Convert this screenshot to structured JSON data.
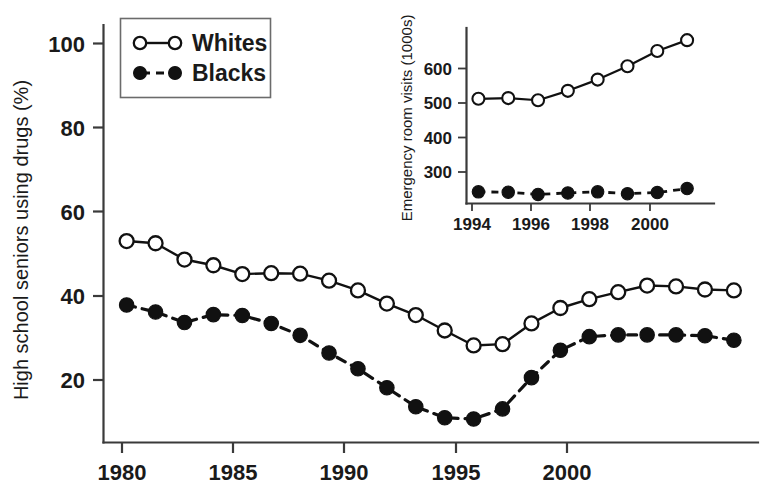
{
  "chart_data": [
    {
      "id": "main",
      "type": "line",
      "title": "",
      "xlabel": "",
      "ylabel": "High school seniors using drugs (%)",
      "xlim": [
        1979.2,
        2001.8
      ],
      "ylim": [
        10.5,
        104
      ],
      "grid": false,
      "legend_position": "top-left",
      "x_ticks": [
        1980,
        1985,
        1990,
        1995,
        2000
      ],
      "x_tick_labels": [
        "1980",
        "1985",
        "1990",
        "1995",
        "2000"
      ],
      "y_ticks": [
        20,
        40,
        60,
        80,
        100
      ],
      "y_tick_labels": [
        "20",
        "40",
        "60",
        "80",
        "100"
      ],
      "x": [
        1980,
        1981,
        1982,
        1983,
        1984,
        1985,
        1986,
        1987,
        1988,
        1989,
        1990,
        1991,
        1992,
        1993,
        1994,
        1995,
        1996,
        1997,
        1998,
        1999,
        2000,
        2001
      ],
      "series": [
        {
          "name": "Whites",
          "marker": "open-circle",
          "linestyle": "solid",
          "values": [
            55.2,
            54.7,
            51.0,
            49.7,
            47.7,
            47.9,
            47.8,
            46.2,
            44.0,
            41.0,
            38.4,
            34.9,
            31.5,
            31.8,
            36.5,
            40.0,
            42.0,
            43.6,
            45.1,
            44.9,
            44.2,
            44.0
          ]
        },
        {
          "name": "Blacks",
          "marker": "filled-circle",
          "linestyle": "dashed",
          "values": [
            40.7,
            39.1,
            36.7,
            38.5,
            38.3,
            36.5,
            33.8,
            29.8,
            26.2,
            21.9,
            17.6,
            15.1,
            14.8,
            17.1,
            24.2,
            30.4,
            33.5,
            33.9,
            33.9,
            33.9,
            33.7,
            32.7
          ]
        }
      ]
    },
    {
      "id": "inset",
      "type": "line",
      "title": "",
      "xlabel": "",
      "ylabel": "Emergency room visits (1000s)",
      "xlim": [
        1993.6,
        2001.5
      ],
      "ylim": [
        215,
        690
      ],
      "grid": false,
      "legend_position": "none",
      "x_ticks": [
        1994,
        1996,
        1998,
        2000
      ],
      "x_tick_labels": [
        "1994",
        "1996",
        "1998",
        "2000"
      ],
      "y_ticks": [
        300,
        400,
        500,
        600
      ],
      "y_tick_labels": [
        "300",
        "400",
        "500",
        "600"
      ],
      "x": [
        1994,
        1995,
        1996,
        1997,
        1998,
        1999,
        2000,
        2001
      ],
      "series": [
        {
          "name": "Whites",
          "marker": "open-circle",
          "linestyle": "solid",
          "values": [
            500,
            502,
            496,
            522,
            553,
            590,
            632,
            662
          ]
        },
        {
          "name": "Blacks",
          "marker": "filled-circle",
          "linestyle": "dashed",
          "values": [
            243,
            242,
            236,
            240,
            243,
            238,
            241,
            252
          ]
        }
      ]
    }
  ],
  "legend": {
    "items": [
      {
        "label": "Whites",
        "marker": "open-circle",
        "linestyle": "solid"
      },
      {
        "label": "Blacks",
        "marker": "filled-circle",
        "linestyle": "dashed"
      }
    ]
  },
  "main_axis": {
    "y_title": "High school seniors using drugs (%)",
    "y_tick_labels": [
      "100",
      "80",
      "60",
      "40",
      "20"
    ],
    "x_tick_labels": [
      "1980",
      "1985",
      "1990",
      "1995",
      "2000"
    ]
  },
  "inset_axis": {
    "y_title": "Emergency room visits (1000s)",
    "y_tick_labels": [
      "600",
      "500",
      "400",
      "300"
    ],
    "x_tick_labels": [
      "1994",
      "1996",
      "1998",
      "2000"
    ]
  },
  "colors": {
    "line": "#111111",
    "axis": "#3a3a3a",
    "background": "#ffffff",
    "legend_border": "#6b6b6b"
  }
}
